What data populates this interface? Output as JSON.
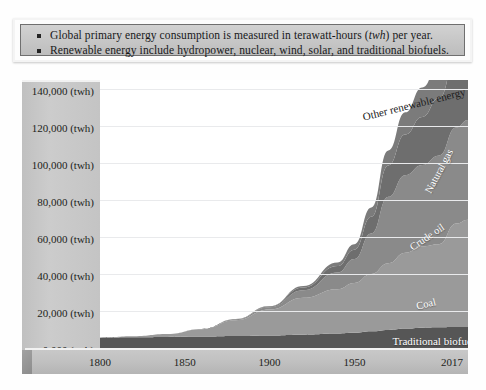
{
  "note": {
    "lines": [
      {
        "pre": "Global primary energy consumption is measured in terawatt-hours (",
        "em": "twh",
        "post": ") per year."
      },
      {
        "pre": "Renewable energy include hydropower, nuclear, wind, solar, and traditional biofuels.",
        "em": "",
        "post": ""
      }
    ],
    "line1_pre": "Global primary energy consumption is measured in terawatt-hours (",
    "line1_em": "twh",
    "line1_post": ") per year.",
    "line2_pre": "Renewable energy include hydropower, nuclear, wind, solar, and traditional biofuels."
  },
  "chart_data": {
    "type": "area",
    "title": "",
    "subtitle": "",
    "xlabel": "",
    "ylabel": "",
    "stacked": true,
    "grid": true,
    "legend_position": "inline-labels",
    "xlim": [
      1800,
      2017
    ],
    "ylim": [
      0,
      145000
    ],
    "yticks": [
      0,
      20000,
      40000,
      60000,
      80000,
      100000,
      120000,
      140000
    ],
    "ytick_labels": [
      "0,000 (twh)",
      "20,000 (twh)",
      "40,000 (twh)",
      "60,000 (twh)",
      "80,000 (twh)",
      "100,000 (twh)",
      "120,000 (twh)",
      "140,000 (twh)"
    ],
    "unit": "twh",
    "xticks": [
      1800,
      1850,
      1900,
      1950,
      2017
    ],
    "xtick_labels": [
      "1800",
      "1850",
      "1900",
      "1950",
      "2017"
    ],
    "x": [
      1800,
      1820,
      1840,
      1860,
      1880,
      1900,
      1920,
      1940,
      1950,
      1960,
      1970,
      1980,
      1990,
      2000,
      2010,
      2017
    ],
    "series": [
      {
        "name": "Traditional biofuels",
        "color": "#565656",
        "label_color": "#ffffff",
        "values": [
          5600,
          5800,
          6000,
          6200,
          6500,
          6800,
          7200,
          7800,
          8200,
          9000,
          9800,
          10500,
          11000,
          11200,
          11300,
          11400
        ]
      },
      {
        "name": "Coal",
        "color": "#9a9a9a",
        "label_color": "#ffffff",
        "values": [
          100,
          600,
          1600,
          4000,
          8500,
          14000,
          20000,
          24000,
          27000,
          31000,
          36000,
          41000,
          44000,
          45000,
          56000,
          58000
        ]
      },
      {
        "name": "Crude oil",
        "color": "#8a8a8a",
        "label_color": "#ffffff",
        "values": [
          0,
          0,
          0,
          100,
          500,
          1200,
          4000,
          9000,
          13000,
          22000,
          36000,
          42000,
          44000,
          48000,
          52000,
          54000
        ]
      },
      {
        "name": "Natural gas",
        "color": "#6e6e6e",
        "label_color": "#ffffff",
        "values": [
          0,
          0,
          0,
          0,
          100,
          400,
          1500,
          3500,
          5000,
          9000,
          17000,
          22000,
          26000,
          31000,
          38000,
          41000
        ]
      },
      {
        "name": "Other renewable energy",
        "color": "#7b7b7b",
        "label_color": "#1b1b1b",
        "values": [
          0,
          0,
          0,
          0,
          100,
          300,
          900,
          2000,
          3000,
          5000,
          8000,
          12000,
          16000,
          19000,
          24000,
          27000
        ]
      }
    ],
    "annotations": [
      {
        "text": "Other renewable energy",
        "x": 1985,
        "y": 132000,
        "rotation": -14,
        "color": "#1b1b1b"
      },
      {
        "text": "Natural gas",
        "x": 2000,
        "y": 96000,
        "rotation": -62,
        "color": "#ffffff"
      },
      {
        "text": "Crude oil",
        "x": 1993,
        "y": 60000,
        "rotation": -34,
        "color": "#ffffff"
      },
      {
        "text": "Coal",
        "x": 1992,
        "y": 24000,
        "rotation": -14,
        "color": "#ffffff"
      },
      {
        "text": "Traditional biofuels",
        "x": 1998,
        "y": 4000,
        "rotation": 0,
        "color": "#ffffff"
      }
    ]
  }
}
